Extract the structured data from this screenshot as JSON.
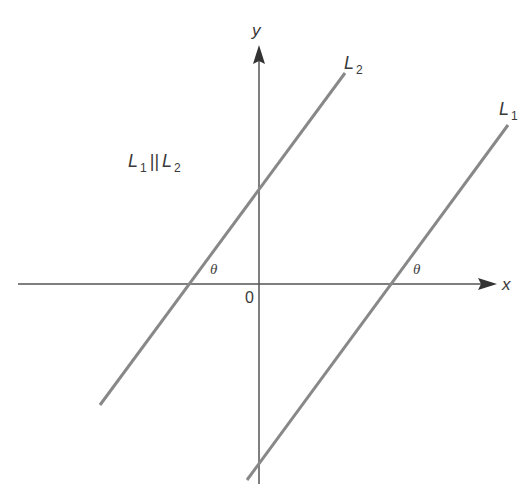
{
  "diagram": {
    "axes": {
      "x_label": "x",
      "y_label": "y",
      "origin_label": "0"
    },
    "lines": [
      {
        "name": "L",
        "subscript": "1",
        "id": "L1"
      },
      {
        "name": "L",
        "subscript": "2",
        "id": "L2"
      }
    ],
    "relation": {
      "left": "L",
      "left_sub": "1",
      "symbol": "||",
      "right": "L",
      "right_sub": "2"
    },
    "angle_label": "θ",
    "colors": {
      "axis": "#555555",
      "line": "#888888",
      "text": "#3a3a3a"
    }
  }
}
